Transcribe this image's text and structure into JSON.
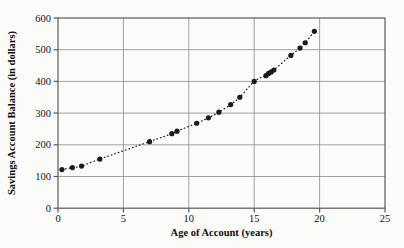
{
  "chart_data": {
    "type": "scatter",
    "title": "",
    "xlabel": "Age of Account (years)",
    "ylabel": "Savings Account Balance (in dollars)",
    "xlim": [
      0,
      25
    ],
    "ylim": [
      0,
      600
    ],
    "xticks": [
      0,
      5,
      10,
      15,
      20,
      25
    ],
    "yticks": [
      0,
      100,
      200,
      300,
      400,
      500,
      600
    ],
    "xtick_labels": [
      "0",
      "5",
      "10",
      "15",
      "20",
      "25"
    ],
    "ytick_labels": [
      "0",
      "100",
      "200",
      "300",
      "400",
      "500",
      "600"
    ],
    "grid": true,
    "legend": false,
    "marker": "filled-circle",
    "trend": {
      "style": "dotted",
      "description": "dotted curve of best fit rising through the points"
    },
    "points": [
      {
        "x": 0.3,
        "y": 122
      },
      {
        "x": 1.1,
        "y": 128
      },
      {
        "x": 1.8,
        "y": 133
      },
      {
        "x": 3.2,
        "y": 155
      },
      {
        "x": 7.0,
        "y": 210
      },
      {
        "x": 8.7,
        "y": 235
      },
      {
        "x": 9.1,
        "y": 243
      },
      {
        "x": 10.6,
        "y": 268
      },
      {
        "x": 11.5,
        "y": 285
      },
      {
        "x": 12.3,
        "y": 303
      },
      {
        "x": 13.2,
        "y": 327
      },
      {
        "x": 13.9,
        "y": 350
      },
      {
        "x": 15.0,
        "y": 400
      },
      {
        "x": 15.9,
        "y": 418
      },
      {
        "x": 16.1,
        "y": 425
      },
      {
        "x": 16.3,
        "y": 430
      },
      {
        "x": 16.5,
        "y": 436
      },
      {
        "x": 17.8,
        "y": 482
      },
      {
        "x": 18.5,
        "y": 505
      },
      {
        "x": 18.9,
        "y": 522
      },
      {
        "x": 19.6,
        "y": 558
      }
    ],
    "series": [
      {
        "name": "Savings account balances",
        "x": [
          0.3,
          1.1,
          1.8,
          3.2,
          7.0,
          8.7,
          9.1,
          10.6,
          11.5,
          12.3,
          13.2,
          13.9,
          15.0,
          15.9,
          16.1,
          16.3,
          16.5,
          17.8,
          18.5,
          18.9,
          19.6
        ],
        "values": [
          122,
          128,
          133,
          155,
          210,
          235,
          243,
          268,
          285,
          303,
          327,
          350,
          400,
          418,
          425,
          430,
          436,
          482,
          505,
          522,
          558
        ]
      }
    ],
    "colors": {
      "marker": "#1b1b1b",
      "grid": "#8c8c8c",
      "frame": "#5a5a5a",
      "background": "#fbfbfa",
      "text": "#141414"
    }
  }
}
